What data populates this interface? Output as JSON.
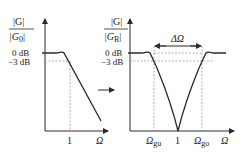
{
  "left_plot": {
    "ylabel_num": "|G|",
    "ylabel_den": "|G",
    "ylabel_den_sub": "0",
    "ylabel_den_close": "|",
    "tick_0db": "0 dB",
    "tick_3db": "−3 dB",
    "xtick_1": "1",
    "xlabel": "Ω"
  },
  "transform_arrow": "right-arrow",
  "right_plot": {
    "ylabel_num": "|G|",
    "ylabel_den": "|G",
    "ylabel_den_sub": "R",
    "ylabel_den_close": "|",
    "tick_0db": "0 dB",
    "tick_3db": "−3 dB",
    "bandwidth_label": "ΔΩ",
    "xtick_gu": "Ω",
    "xtick_gu_sub": "gu",
    "xtick_1": "1",
    "xtick_go": "Ω",
    "xtick_go_sub": "go",
    "xlabel": "Ω"
  },
  "colors": {
    "line": "#2a2a2a",
    "dashed": "#9a9a9a"
  }
}
